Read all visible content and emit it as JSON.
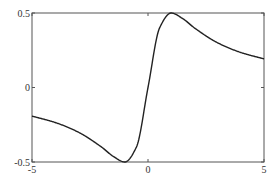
{
  "chart_data": {
    "type": "line",
    "title": "",
    "xlabel": "",
    "ylabel": "",
    "xlim": [
      -5,
      5
    ],
    "ylim": [
      -0.5,
      0.5
    ],
    "grid": false,
    "legend": null,
    "x_ticks": [
      "-5",
      "0",
      "5"
    ],
    "y_ticks": [
      "-0.5",
      "0",
      "0.5"
    ],
    "series": [
      {
        "name": "f(x) = x/(1+x^2)",
        "color": "#222222",
        "x": [
          -5,
          -4,
          -3,
          -2,
          -1.5,
          -1,
          -0.5,
          0,
          0.5,
          1,
          1.5,
          2,
          3,
          4,
          5
        ],
        "y": [
          -0.192,
          -0.235,
          -0.3,
          -0.4,
          -0.462,
          -0.5,
          -0.4,
          0,
          0.4,
          0.5,
          0.462,
          0.4,
          0.3,
          0.235,
          0.192
        ]
      }
    ]
  }
}
